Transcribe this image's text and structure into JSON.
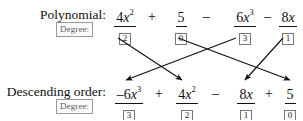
{
  "rows": {
    "polynomial": {
      "label": "Polynomial:",
      "degree_label": "Degree:",
      "terms": [
        {
          "coef": "4",
          "var": "x",
          "exp": "2",
          "degree": "2",
          "sign": ""
        },
        {
          "coef": "5",
          "var": "",
          "exp": "",
          "degree": "0",
          "sign": "+"
        },
        {
          "coef": "6",
          "var": "x",
          "exp": "3",
          "degree": "3",
          "sign": "–"
        },
        {
          "coef": "8",
          "var": "x",
          "exp": "",
          "degree": "1",
          "sign": "–"
        }
      ]
    },
    "descending": {
      "label": "Descending order:",
      "degree_label": "Degree:",
      "terms": [
        {
          "coef": "–6",
          "var": "x",
          "exp": "3",
          "degree": "3",
          "sign": ""
        },
        {
          "coef": "4",
          "var": "x",
          "exp": "2",
          "degree": "2",
          "sign": "+"
        },
        {
          "coef": "8",
          "var": "x",
          "exp": "",
          "degree": "1",
          "sign": "–"
        },
        {
          "coef": "5",
          "var": "",
          "exp": "",
          "degree": "0",
          "sign": "+"
        }
      ]
    }
  },
  "arrows": [
    {
      "name": "arrow-4x2-to-4x2",
      "from_term": "4x^2",
      "to_term": "4x^2"
    },
    {
      "name": "arrow-5-to-5",
      "from_term": "5",
      "to_term": "5"
    },
    {
      "name": "arrow-6x3-to-6x3",
      "from_term": "6x^3",
      "to_term": "-6x^3"
    },
    {
      "name": "arrow-8x-to-8x",
      "from_term": "8x",
      "to_term": "8x"
    }
  ],
  "colors": {
    "ink": "#101010",
    "chip_border": "#9a9a9a",
    "chip_text": "#5d5d5d",
    "background": "#ffffff"
  }
}
